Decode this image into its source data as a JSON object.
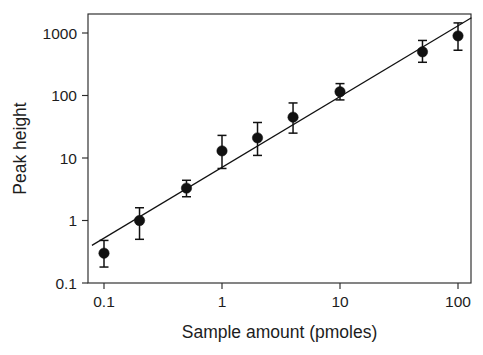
{
  "chart_data": {
    "type": "scatter",
    "title": "",
    "subtitle": "",
    "xlabel": "Sample amount (pmoles)",
    "ylabel": "Peak height",
    "xscale": "log",
    "yscale": "log",
    "xlim": [
      0.075,
      135
    ],
    "ylim": [
      0.1,
      2000
    ],
    "grid": false,
    "legend": null,
    "xticks": [
      0.1,
      1,
      10,
      100
    ],
    "xtick_labels": [
      "0.1",
      "1",
      "10",
      "100"
    ],
    "yticks": [
      0.1,
      1,
      10,
      100,
      1000
    ],
    "ytick_labels": [
      "0.1",
      "1",
      "10",
      "100",
      "1000"
    ],
    "series": [
      {
        "name": "Peak height vs sample amount",
        "marker": "filled-circle",
        "color": "#111111",
        "x": [
          0.1,
          0.2,
          0.5,
          1,
          2,
          4,
          10,
          50,
          100
        ],
        "y": [
          0.3,
          1.0,
          3.3,
          13,
          21,
          45,
          115,
          500,
          900
        ],
        "yerr_low": [
          0.18,
          0.5,
          2.4,
          6.8,
          11,
          25,
          85,
          340,
          530
        ],
        "yerr_high": [
          0.48,
          1.6,
          4.4,
          23,
          37,
          76,
          155,
          760,
          1450
        ]
      }
    ],
    "fit_line": {
      "name": "linear regression (log-log)",
      "color": "#111111",
      "x_start": 0.079,
      "y_start": 0.4,
      "x_end": 130,
      "y_end": 1750
    },
    "annotations": []
  },
  "axes": {
    "x_axis_name": "Sample amount (pmoles)",
    "y_axis_name": "Peak height"
  }
}
